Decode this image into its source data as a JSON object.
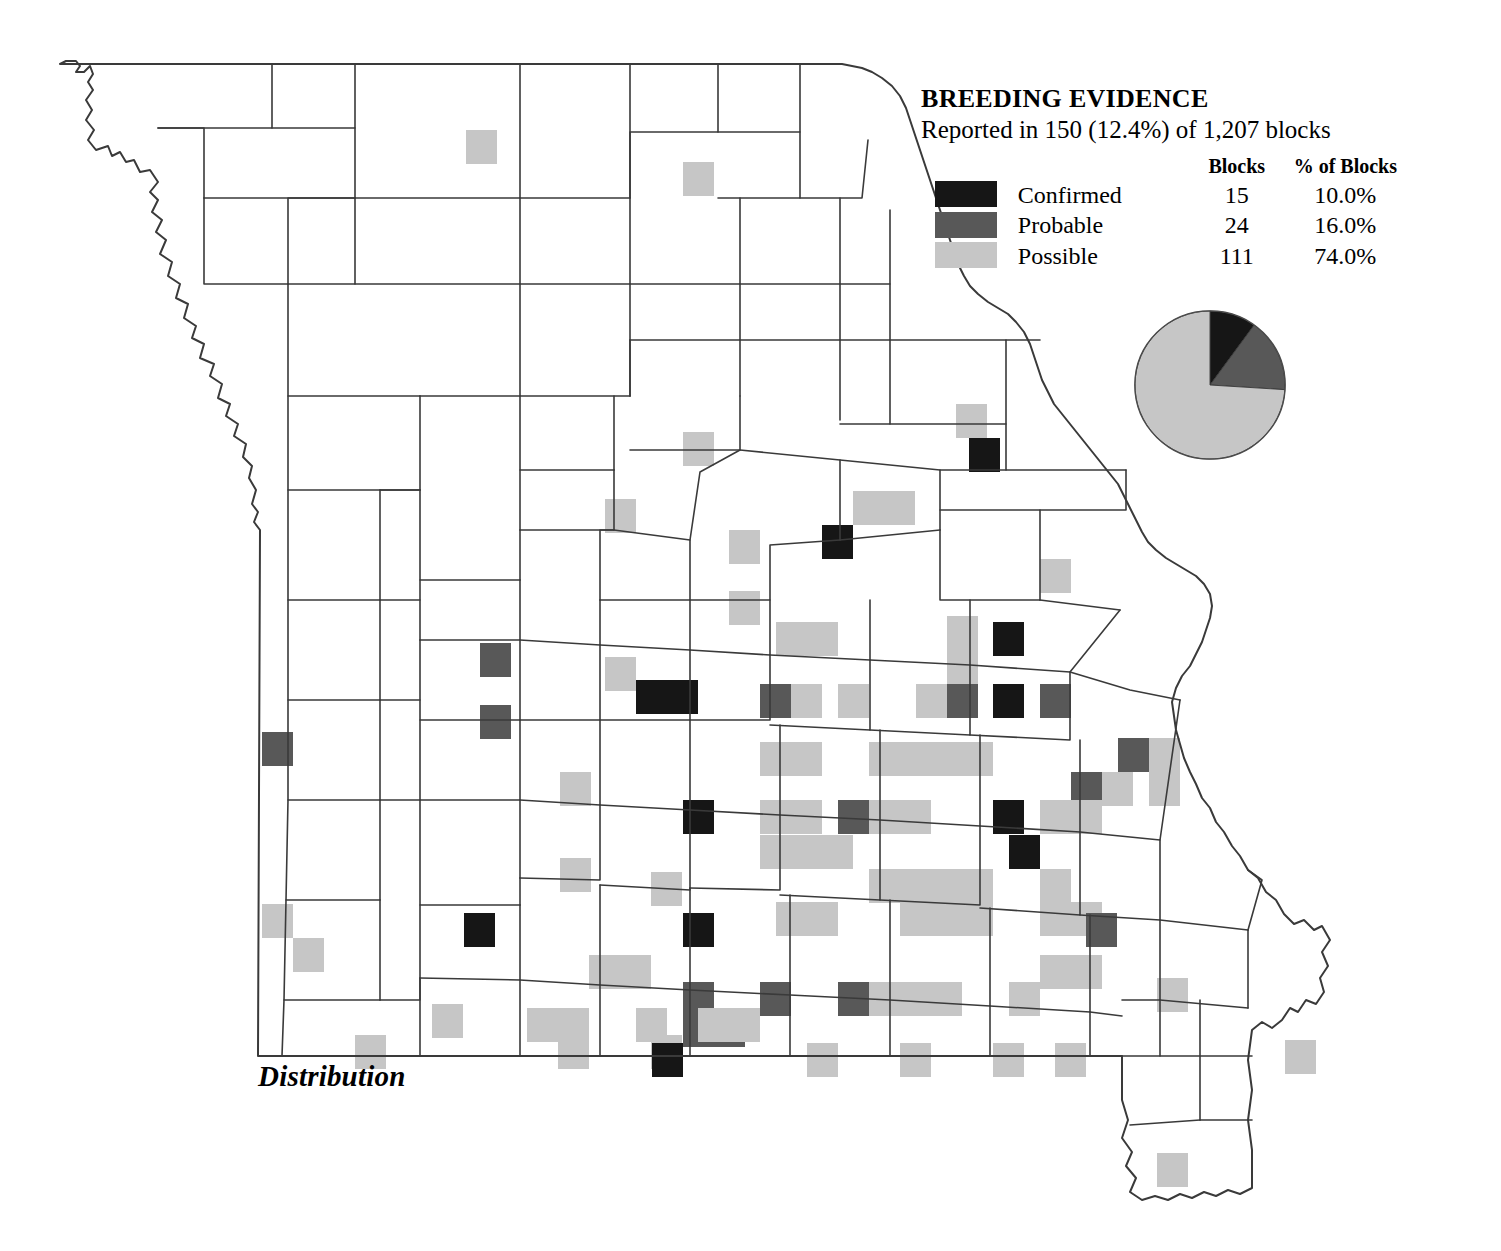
{
  "legend": {
    "title": "BREEDING EVIDENCE",
    "subtitle": "Reported in 150 (12.4%) of 1,207 blocks",
    "col_blank": "",
    "col_blocks": "Blocks",
    "col_pct": "% of Blocks",
    "rows": [
      {
        "label": "Confirmed",
        "blocks": "15",
        "pct": "10.0%",
        "color": "#161616"
      },
      {
        "label": "Probable",
        "blocks": "24",
        "pct": "16.0%",
        "color": "#585858"
      },
      {
        "label": "Possible",
        "blocks": "111",
        "pct": "74.0%",
        "color": "#c6c6c6"
      }
    ]
  },
  "caption": "Distribution",
  "map": {
    "region": "Missouri",
    "total_blocks": "1,207",
    "reported_blocks": "150",
    "reported_pct": "12.4%"
  },
  "chart_data": {
    "type": "pie",
    "title": "BREEDING EVIDENCE",
    "subtitle": "Reported in 150 (12.4%) of 1,207 blocks",
    "categories": [
      "Confirmed",
      "Probable",
      "Possible"
    ],
    "values": [
      15,
      24,
      111
    ],
    "percents": [
      10.0,
      16.0,
      74.0
    ],
    "colors": [
      "#161616",
      "#585858",
      "#c6c6c6"
    ],
    "legend_position": "above",
    "total": 150,
    "start_angle_deg": 0,
    "direction": "clockwise"
  },
  "block_grid": {
    "cell_w": 31,
    "cell_h": 34,
    "note": "Atlas survey blocks shaded by highest breeding-evidence level",
    "cells": [
      [
        466,
        130,
        "possible"
      ],
      [
        683,
        162,
        "possible"
      ],
      [
        956,
        404,
        "possible"
      ],
      [
        969,
        438,
        "confirmed"
      ],
      [
        683,
        432,
        "possible"
      ],
      [
        605,
        499,
        "possible"
      ],
      [
        729,
        530,
        "possible"
      ],
      [
        822,
        525,
        "confirmed"
      ],
      [
        853,
        491,
        "possible"
      ],
      [
        884,
        491,
        "possible"
      ],
      [
        1040,
        559,
        "possible"
      ],
      [
        729,
        591,
        "possible"
      ],
      [
        480,
        643,
        "probable"
      ],
      [
        605,
        657,
        "possible"
      ],
      [
        776,
        622,
        "possible"
      ],
      [
        807,
        622,
        "possible"
      ],
      [
        947,
        616,
        "possible"
      ],
      [
        947,
        650,
        "possible"
      ],
      [
        993,
        622,
        "confirmed"
      ],
      [
        1040,
        684,
        "probable"
      ],
      [
        480,
        705,
        "probable"
      ],
      [
        636,
        680,
        "confirmed"
      ],
      [
        667,
        680,
        "confirmed"
      ],
      [
        760,
        684,
        "probable"
      ],
      [
        791,
        684,
        "possible"
      ],
      [
        838,
        684,
        "possible"
      ],
      [
        916,
        684,
        "possible"
      ],
      [
        947,
        684,
        "probable"
      ],
      [
        993,
        684,
        "confirmed"
      ],
      [
        1118,
        738,
        "probable"
      ],
      [
        1149,
        738,
        "possible"
      ],
      [
        262,
        732,
        "probable"
      ],
      [
        1071,
        772,
        "probable"
      ],
      [
        1102,
        772,
        "possible"
      ],
      [
        1149,
        772,
        "possible"
      ],
      [
        760,
        742,
        "possible"
      ],
      [
        791,
        742,
        "possible"
      ],
      [
        869,
        742,
        "possible"
      ],
      [
        900,
        742,
        "possible"
      ],
      [
        931,
        742,
        "possible"
      ],
      [
        962,
        742,
        "possible"
      ],
      [
        560,
        772,
        "possible"
      ],
      [
        683,
        800,
        "confirmed"
      ],
      [
        760,
        800,
        "possible"
      ],
      [
        791,
        800,
        "possible"
      ],
      [
        838,
        800,
        "probable"
      ],
      [
        869,
        800,
        "possible"
      ],
      [
        900,
        800,
        "possible"
      ],
      [
        993,
        800,
        "confirmed"
      ],
      [
        1040,
        800,
        "possible"
      ],
      [
        1071,
        800,
        "possible"
      ],
      [
        560,
        858,
        "possible"
      ],
      [
        651,
        872,
        "possible"
      ],
      [
        760,
        835,
        "possible"
      ],
      [
        791,
        835,
        "possible"
      ],
      [
        822,
        835,
        "possible"
      ],
      [
        869,
        869,
        "possible"
      ],
      [
        900,
        869,
        "possible"
      ],
      [
        931,
        869,
        "possible"
      ],
      [
        962,
        869,
        "possible"
      ],
      [
        1009,
        835,
        "confirmed"
      ],
      [
        1040,
        869,
        "possible"
      ],
      [
        262,
        904,
        "possible"
      ],
      [
        293,
        938,
        "possible"
      ],
      [
        464,
        913,
        "confirmed"
      ],
      [
        683,
        913,
        "confirmed"
      ],
      [
        776,
        902,
        "possible"
      ],
      [
        807,
        902,
        "possible"
      ],
      [
        900,
        902,
        "possible"
      ],
      [
        931,
        902,
        "possible"
      ],
      [
        962,
        902,
        "possible"
      ],
      [
        1040,
        902,
        "possible"
      ],
      [
        1071,
        902,
        "possible"
      ],
      [
        1086,
        913,
        "probable"
      ],
      [
        589,
        955,
        "possible"
      ],
      [
        620,
        955,
        "possible"
      ],
      [
        683,
        982,
        "probable"
      ],
      [
        683,
        1013,
        "probable"
      ],
      [
        714,
        1013,
        "probable"
      ],
      [
        760,
        982,
        "probable"
      ],
      [
        838,
        982,
        "probable"
      ],
      [
        869,
        982,
        "possible"
      ],
      [
        900,
        982,
        "possible"
      ],
      [
        931,
        982,
        "possible"
      ],
      [
        1009,
        982,
        "possible"
      ],
      [
        1040,
        955,
        "possible"
      ],
      [
        1071,
        955,
        "possible"
      ],
      [
        1157,
        978,
        "possible"
      ],
      [
        432,
        1004,
        "possible"
      ],
      [
        355,
        1035,
        "possible"
      ],
      [
        527,
        1008,
        "possible"
      ],
      [
        558,
        1008,
        "possible"
      ],
      [
        558,
        1035,
        "possible"
      ],
      [
        636,
        1008,
        "possible"
      ],
      [
        651,
        1035,
        "possible"
      ],
      [
        652,
        1043,
        "confirmed"
      ],
      [
        698,
        1008,
        "possible"
      ],
      [
        729,
        1008,
        "possible"
      ],
      [
        807,
        1043,
        "possible"
      ],
      [
        900,
        1043,
        "possible"
      ],
      [
        993,
        1043,
        "possible"
      ],
      [
        1055,
        1043,
        "possible"
      ],
      [
        1285,
        1040,
        "possible"
      ],
      [
        1157,
        1153,
        "possible"
      ]
    ]
  }
}
